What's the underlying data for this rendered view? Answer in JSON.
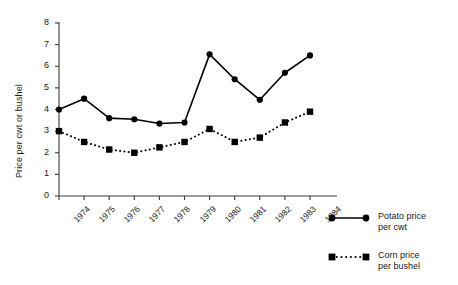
{
  "chart_data": {
    "type": "line",
    "title": "",
    "xlabel": "",
    "ylabel": "Price per cwt or bushel",
    "categories": [
      "1974",
      "1975",
      "1976",
      "1977",
      "1978",
      "1979",
      "1980",
      "1981",
      "1982",
      "1983",
      "1984"
    ],
    "ylim": [
      0,
      8
    ],
    "y_ticks": [
      "0",
      "1",
      "2",
      "3",
      "4",
      "5",
      "6",
      "7",
      "8"
    ],
    "grid": false,
    "legend_position": "right",
    "series": [
      {
        "name": "Potato price per cwt",
        "legend_line1": "Potato price",
        "legend_line2": "per cwt",
        "marker": "circle",
        "linestyle": "solid",
        "color": "#000000",
        "values": [
          4.0,
          4.5,
          3.6,
          3.55,
          3.35,
          3.4,
          6.55,
          5.4,
          4.45,
          5.7,
          6.5
        ]
      },
      {
        "name": "Corn price per bushel",
        "legend_line1": "Corn price",
        "legend_line2": "per bushel",
        "marker": "square",
        "linestyle": "dotted",
        "color": "#000000",
        "values": [
          3.0,
          2.5,
          2.15,
          2.0,
          2.25,
          2.5,
          3.1,
          2.5,
          2.7,
          3.4,
          3.9
        ]
      }
    ]
  },
  "colors": {
    "axis": "#3a3a3a",
    "ink": "#000000",
    "background": "#ffffff"
  }
}
